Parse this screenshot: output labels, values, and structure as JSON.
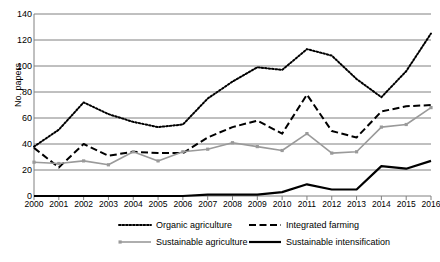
{
  "chart_data": {
    "type": "line",
    "title": "",
    "xlabel": "",
    "ylabel": "No. papers",
    "ylim": [
      0,
      140
    ],
    "ytick_step": 20,
    "yticks": [
      0,
      20,
      40,
      60,
      80,
      100,
      120,
      140
    ],
    "grid": true,
    "legend_position": "bottom",
    "categories": [
      "2000",
      "2001",
      "2002",
      "2003",
      "2004",
      "2005",
      "2006",
      "2007",
      "2008",
      "2009",
      "2010",
      "2011",
      "2012",
      "2013",
      "2014",
      "2015",
      "2016"
    ],
    "x": [
      2000,
      2001,
      2002,
      2003,
      2004,
      2005,
      2006,
      2007,
      2008,
      2009,
      2010,
      2011,
      2012,
      2013,
      2014,
      2015,
      2016
    ],
    "series": [
      {
        "name": "Organic agriculture",
        "style": "dotted",
        "color": "#000000",
        "values": [
          38,
          51,
          72,
          63,
          57,
          53,
          55,
          75,
          88,
          99,
          97,
          113,
          108,
          90,
          76,
          96,
          125
        ]
      },
      {
        "name": "Integrated farming",
        "style": "dashed",
        "color": "#000000",
        "values": [
          37,
          22,
          40,
          31,
          34,
          33,
          33,
          45,
          53,
          58,
          48,
          78,
          50,
          45,
          65,
          69,
          70
        ]
      },
      {
        "name": "Sustainable agriculture",
        "style": "solid-marker",
        "color": "#9a9a9a",
        "values": [
          26,
          25,
          27,
          24,
          34,
          27,
          34,
          36,
          41,
          38,
          35,
          48,
          33,
          34,
          53,
          55,
          68
        ]
      },
      {
        "name": "Sustainable intensification",
        "style": "solid-thick",
        "color": "#000000",
        "values": [
          0,
          0,
          0,
          0,
          0,
          0,
          0,
          1,
          1,
          1,
          3,
          9,
          5,
          5,
          23,
          21,
          27
        ]
      }
    ]
  },
  "legend": {
    "items": [
      {
        "label": "Organic agriculture"
      },
      {
        "label": "Integrated farming"
      },
      {
        "label": "Sustainable agriculture"
      },
      {
        "label": "Sustainable intensification"
      }
    ]
  }
}
